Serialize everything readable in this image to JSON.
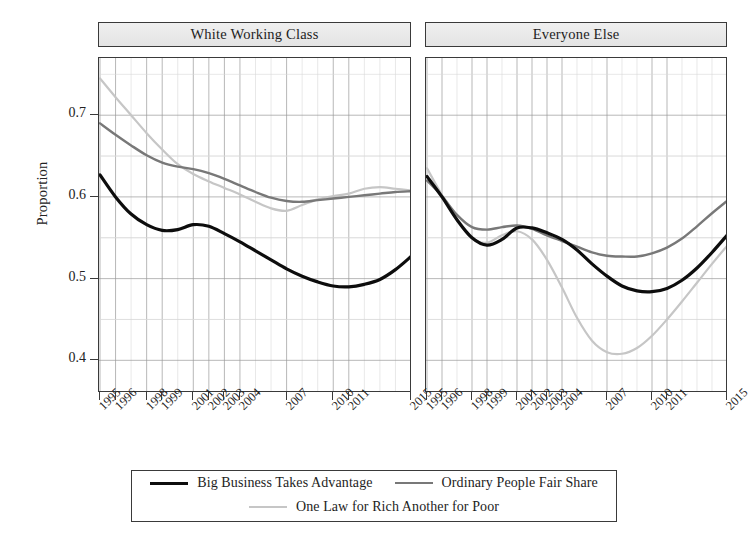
{
  "chart_data": {
    "type": "line",
    "title": "",
    "xlabel": "",
    "ylabel": "Proportion",
    "ylim": [
      0.36,
      0.77
    ],
    "xlim": [
      1995,
      2015
    ],
    "grid": true,
    "legend_position": "bottom",
    "y_ticks": [
      "0.4",
      "0.5",
      "0.6",
      "0.7"
    ],
    "y_tick_values": [
      0.4,
      0.5,
      0.6,
      0.7
    ],
    "x_ticks": [
      "1995",
      "1996",
      "1998",
      "1999",
      "2001",
      "2002",
      "2003",
      "2004",
      "2007",
      "2010",
      "2011",
      "2015"
    ],
    "x_tick_values": [
      1995,
      1996,
      1998,
      1999,
      2001,
      2002,
      2003,
      2004,
      2007,
      2010,
      2011,
      2015
    ],
    "panels": [
      {
        "label": "White Working Class",
        "series": [
          {
            "name": "Big Business Takes Advantage",
            "color": "#0d0d0d",
            "width": 3.2,
            "x": [
              1995,
              1996,
              1997,
              1998,
              1999,
              2000,
              2001,
              2002,
              2003,
              2004,
              2005,
              2006,
              2007,
              2008,
              2009,
              2010,
              2011,
              2012,
              2013,
              2014,
              2015
            ],
            "y": [
              0.627,
              0.6,
              0.579,
              0.566,
              0.559,
              0.56,
              0.566,
              0.564,
              0.555,
              0.545,
              0.534,
              0.523,
              0.512,
              0.503,
              0.496,
              0.491,
              0.49,
              0.493,
              0.499,
              0.511,
              0.527
            ]
          },
          {
            "name": "Ordinary People Fair Share",
            "color": "#787878",
            "width": 2.4,
            "x": [
              1995,
              1996,
              1997,
              1998,
              1999,
              2000,
              2001,
              2002,
              2003,
              2004,
              2005,
              2006,
              2007,
              2008,
              2009,
              2010,
              2011,
              2012,
              2013,
              2014,
              2015
            ],
            "y": [
              0.69,
              0.676,
              0.663,
              0.651,
              0.642,
              0.637,
              0.634,
              0.629,
              0.622,
              0.614,
              0.606,
              0.599,
              0.595,
              0.594,
              0.596,
              0.598,
              0.6,
              0.602,
              0.604,
              0.606,
              0.607
            ]
          },
          {
            "name": "One Law for Rich Another for Poor",
            "color": "#c6c6c6",
            "width": 2.2,
            "x": [
              1995,
              1996,
              1997,
              1998,
              1999,
              2000,
              2001,
              2002,
              2003,
              2004,
              2005,
              2006,
              2007,
              2008,
              2009,
              2010,
              2011,
              2012,
              2013,
              2014,
              2015
            ],
            "y": [
              0.745,
              0.722,
              0.7,
              0.678,
              0.658,
              0.64,
              0.628,
              0.619,
              0.611,
              0.603,
              0.594,
              0.586,
              0.583,
              0.59,
              0.597,
              0.601,
              0.604,
              0.61,
              0.612,
              0.61,
              0.608
            ]
          }
        ]
      },
      {
        "label": "Everyone Else",
        "series": [
          {
            "name": "Big Business Takes Advantage",
            "color": "#0d0d0d",
            "width": 3.2,
            "x": [
              1995,
              1996,
              1997,
              1998,
              1999,
              2000,
              2001,
              2002,
              2003,
              2004,
              2005,
              2006,
              2007,
              2008,
              2009,
              2010,
              2011,
              2012,
              2013,
              2014,
              2015
            ],
            "y": [
              0.625,
              0.6,
              0.572,
              0.55,
              0.541,
              0.548,
              0.562,
              0.562,
              0.556,
              0.548,
              0.535,
              0.518,
              0.503,
              0.491,
              0.485,
              0.484,
              0.488,
              0.498,
              0.513,
              0.532,
              0.553
            ]
          },
          {
            "name": "Ordinary People Fair Share",
            "color": "#787878",
            "width": 2.4,
            "x": [
              1995,
              1996,
              1997,
              1998,
              1999,
              2000,
              2001,
              2002,
              2003,
              2004,
              2005,
              2006,
              2007,
              2008,
              2009,
              2010,
              2011,
              2012,
              2013,
              2014,
              2015
            ],
            "y": [
              0.62,
              0.601,
              0.578,
              0.563,
              0.56,
              0.563,
              0.565,
              0.561,
              0.553,
              0.546,
              0.539,
              0.532,
              0.528,
              0.527,
              0.527,
              0.531,
              0.538,
              0.549,
              0.564,
              0.58,
              0.595
            ]
          },
          {
            "name": "One Law for Rich Another for Poor",
            "color": "#c6c6c6",
            "width": 2.2,
            "x": [
              1995,
              1996,
              1997,
              1998,
              1999,
              2000,
              2001,
              2002,
              2003,
              2004,
              2005,
              2006,
              2007,
              2008,
              2009,
              2010,
              2011,
              2012,
              2013,
              2014,
              2015
            ],
            "y": [
              0.635,
              0.602,
              0.572,
              0.549,
              0.544,
              0.553,
              0.558,
              0.548,
              0.523,
              0.489,
              0.452,
              0.424,
              0.41,
              0.408,
              0.415,
              0.43,
              0.45,
              0.472,
              0.495,
              0.518,
              0.54
            ]
          }
        ]
      }
    ],
    "legend": [
      {
        "label": "Big Business Takes Advantage",
        "color": "#0d0d0d",
        "width": 3.4
      },
      {
        "label": "Ordinary People Fair Share",
        "color": "#787878",
        "width": 2.4
      },
      {
        "label": "One Law for Rich Another for Poor",
        "color": "#c6c6c6",
        "width": 2.2
      }
    ]
  },
  "axis": {
    "ylabel": "Proportion"
  }
}
